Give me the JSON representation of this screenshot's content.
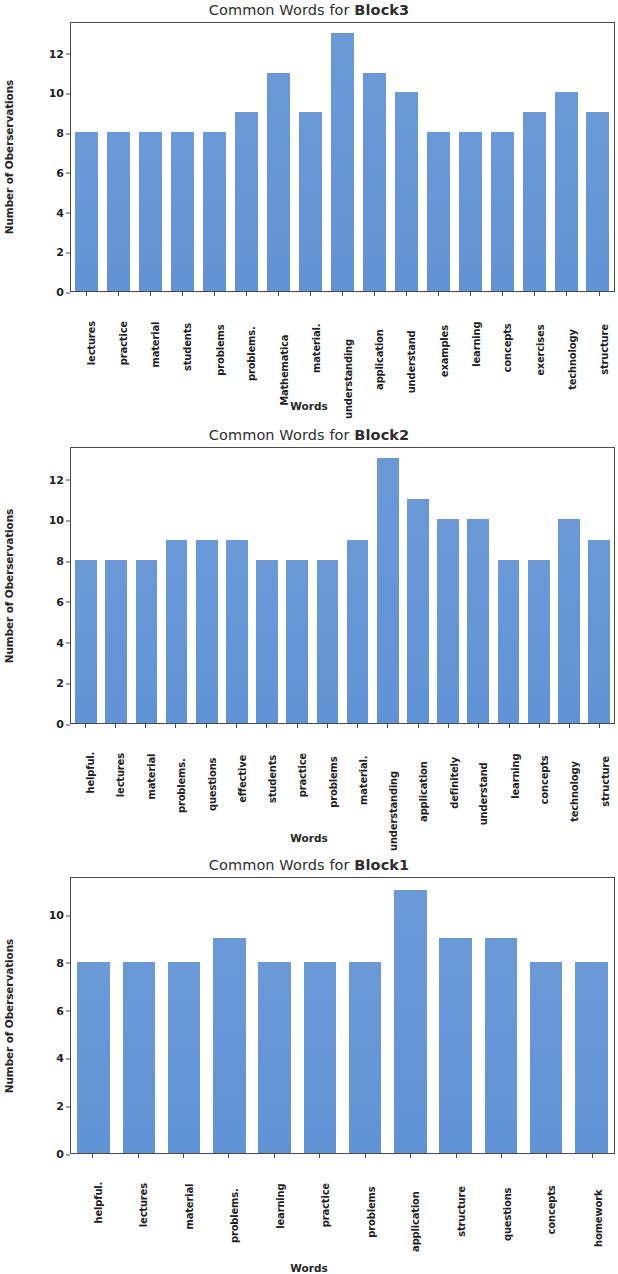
{
  "figure": {
    "background": "#ffffff",
    "bar_color": "#6093d6",
    "axis_color": "#4a4a4a"
  },
  "chart_data": [
    {
      "type": "bar",
      "title_prefix": "Common Words for ",
      "title_block": "Block3",
      "title": "Common Words for Block3",
      "xlabel": "Words",
      "ylabel": "Number of Oberservations",
      "ylim": [
        0,
        13.6
      ],
      "yticks": [
        0,
        2,
        4,
        6,
        8,
        10,
        12
      ],
      "ytick_labels": [
        "0",
        "2",
        "4",
        "6",
        "8",
        "10",
        "12"
      ],
      "grid": false,
      "legend": null,
      "categories": [
        "lectures",
        "practice",
        "material",
        "students",
        "problems",
        "problems.",
        "Mathematica",
        "material.",
        "understanding",
        "application",
        "understand",
        "examples",
        "learning",
        "concepts",
        "exercises",
        "technology",
        "structure"
      ],
      "values": [
        8,
        8,
        8,
        8,
        8,
        9,
        11,
        9,
        13,
        11,
        10,
        8,
        8,
        8,
        9,
        10,
        9
      ]
    },
    {
      "type": "bar",
      "title_prefix": "Common Words for ",
      "title_block": "Block2",
      "title": "Common Words for Block2",
      "xlabel": "Words",
      "ylabel": "Number of Oberservations",
      "ylim": [
        0,
        13.6
      ],
      "yticks": [
        0,
        2,
        4,
        6,
        8,
        10,
        12
      ],
      "ytick_labels": [
        "0",
        "2",
        "4",
        "6",
        "8",
        "10",
        "12"
      ],
      "grid": false,
      "legend": null,
      "categories": [
        "helpful.",
        "lectures",
        "material",
        "problems.",
        "questions",
        "effective",
        "students",
        "practice",
        "problems",
        "material.",
        "understanding",
        "application",
        "definitely",
        "understand",
        "learning",
        "concepts",
        "technology",
        "structure"
      ],
      "values": [
        8,
        8,
        8,
        9,
        9,
        9,
        8,
        8,
        8,
        9,
        13,
        11,
        10,
        10,
        8,
        8,
        10,
        9
      ]
    },
    {
      "type": "bar",
      "title_prefix": "Common Words for ",
      "title_block": "Block1",
      "title": "Common Words for Block1",
      "xlabel": "Words",
      "ylabel": "Number of Oberservations",
      "ylim": [
        0,
        11.6
      ],
      "yticks": [
        0,
        2,
        4,
        6,
        8,
        10
      ],
      "ytick_labels": [
        "0",
        "2",
        "4",
        "6",
        "8",
        "10"
      ],
      "grid": false,
      "legend": null,
      "categories": [
        "helpful.",
        "lectures",
        "material",
        "problems.",
        "learning",
        "practice",
        "problems",
        "application",
        "structure",
        "questions",
        "concepts",
        "homework"
      ],
      "values": [
        8,
        8,
        8,
        9,
        8,
        8,
        8,
        11,
        9,
        9,
        8,
        8
      ]
    }
  ]
}
